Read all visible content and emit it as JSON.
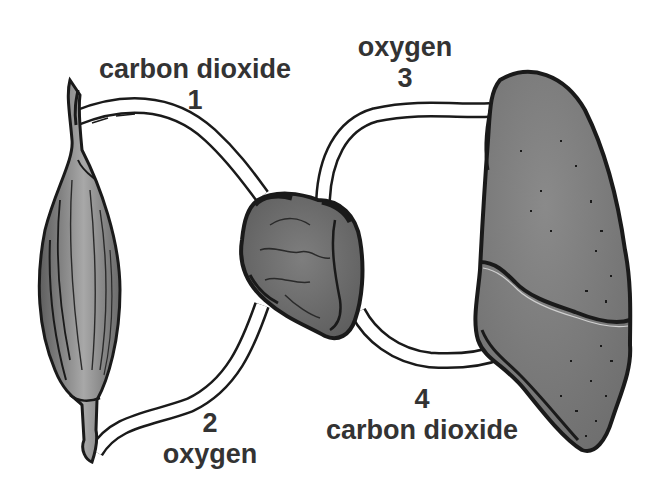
{
  "diagram": {
    "colors": {
      "background": "#ffffff",
      "outline": "#1a1a1a",
      "organ_fill": "#7a7a7a",
      "muscle_fill": "#8c8c8c",
      "label_text": "#333333"
    },
    "organs": [
      {
        "id": "muscle",
        "icon": "muscle-icon",
        "position": "left"
      },
      {
        "id": "heart",
        "icon": "heart-icon",
        "position": "center"
      },
      {
        "id": "lung",
        "icon": "lung-icon",
        "position": "right"
      }
    ],
    "labels": [
      {
        "number": "1",
        "gas": "carbon dioxide",
        "path": "muscle to heart (upper left vessel)"
      },
      {
        "number": "2",
        "gas": "oxygen",
        "path": "heart to muscle (lower left vessel)"
      },
      {
        "number": "3",
        "gas": "oxygen",
        "path": "lung to heart (upper right vessel)"
      },
      {
        "number": "4",
        "gas": "carbon dioxide",
        "path": "heart to lung (lower right vessel)"
      }
    ]
  }
}
